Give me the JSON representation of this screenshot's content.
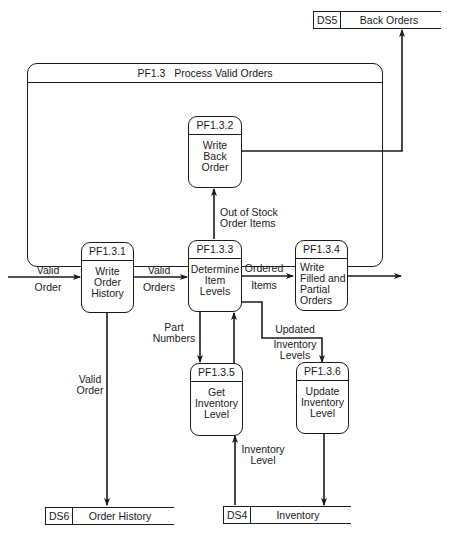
{
  "parent_process": {
    "id": "PF1.3",
    "name": "Process Valid Orders"
  },
  "processes": [
    {
      "id": "PF1.3.1",
      "name": "Write\nOrder\nHistory"
    },
    {
      "id": "PF1.3.2",
      "name": "Write\nBack\nOrder"
    },
    {
      "id": "PF1.3.3",
      "name": "Determine\nItem\nLevels"
    },
    {
      "id": "PF1.3.4",
      "name": "Write\nFilled and\nPartial\nOrders"
    },
    {
      "id": "PF1.3.5",
      "name": "Get\nInventory\nLevel"
    },
    {
      "id": "PF1.3.6",
      "name": "Update\nInventory\nLevel"
    }
  ],
  "data_stores": [
    {
      "id": "DS5",
      "name": "Back Orders"
    },
    {
      "id": "DS6",
      "name": "Order History"
    },
    {
      "id": "DS4",
      "name": "Inventory"
    }
  ],
  "flows": {
    "valid_order_in": [
      "Valid",
      "Order"
    ],
    "valid_orders": [
      "Valid",
      "Orders"
    ],
    "ordered_items": [
      "Ordered",
      "Items"
    ],
    "out_of_stock": [
      "Out of Stock",
      "Order Items"
    ],
    "part_numbers": [
      "Part",
      "Numbers"
    ],
    "updated_inventory": [
      "Updated",
      "Inventory",
      "Levels"
    ],
    "valid_order_down": [
      "Valid",
      "Order"
    ],
    "inventory_level": [
      "Inventory",
      "Level"
    ]
  }
}
